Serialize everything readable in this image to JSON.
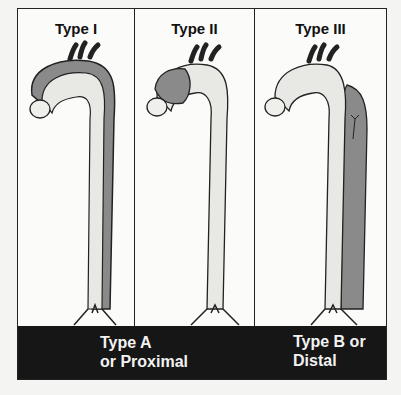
{
  "panels": [
    {
      "title": "Type I",
      "dissection": "ascending + arch + descending"
    },
    {
      "title": "Type II",
      "dissection": "ascending only"
    },
    {
      "title": "Type III",
      "dissection": "descending only"
    }
  ],
  "classification": {
    "type_a": {
      "line1": "Type A",
      "line2": "or Proximal"
    },
    "type_b": {
      "line1": "Type B or",
      "line2": "Distal"
    }
  },
  "colors": {
    "band": "#161616",
    "false_lumen": "#8a8a8a",
    "outline": "#222222"
  }
}
